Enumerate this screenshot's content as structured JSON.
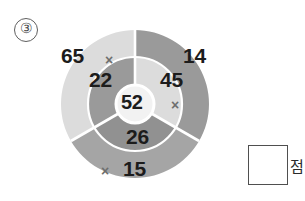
{
  "problem": {
    "number_label": "③"
  },
  "diagram": {
    "type": "concentric-sector-diagram",
    "center": {
      "label": "52"
    },
    "sectors": [
      {
        "name": "left",
        "outer_label": "65",
        "inner_label": "22",
        "outer_color": "#dcdcdc",
        "inner_color": "#9a9a9a"
      },
      {
        "name": "right",
        "outer_label": "14",
        "inner_label": "45",
        "outer_color": "#9a9a9a",
        "inner_color": "#dcdcdc"
      },
      {
        "name": "bottom",
        "outer_label": "15",
        "inner_label": "26",
        "outer_color": "#a5a5a5",
        "inner_color": "#919191"
      }
    ],
    "operators": [
      {
        "name": "left",
        "symbol": "×"
      },
      {
        "name": "right",
        "symbol": "×"
      },
      {
        "name": "bottom",
        "symbol": "×"
      }
    ],
    "center_fill": "#f2f2f2",
    "divider_color": "#ffffff"
  },
  "answer": {
    "value": "",
    "unit_label": "점",
    "box_border_color": "#4f4f4f"
  }
}
